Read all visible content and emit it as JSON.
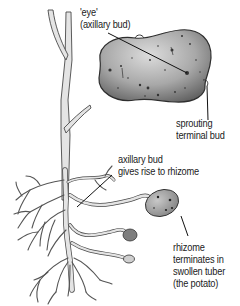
{
  "diagram": {
    "colors": {
      "outline": "#3a3a3a",
      "stem_fill": "#e2e2e2",
      "tuber_fill": "#9a9a9a",
      "tuber_highlight": "#d6d6d6",
      "leader_line": "#111111",
      "background": "#ffffff"
    },
    "labels": [
      {
        "id": "eye",
        "lines": [
          "'eye'",
          "(axillary bud)"
        ]
      },
      {
        "id": "terminal-bud",
        "lines": [
          "sprouting",
          "terminal bud"
        ]
      },
      {
        "id": "axillary-rhizome",
        "lines": [
          "axillary bud",
          "gives rise to rhizome"
        ]
      },
      {
        "id": "tuber",
        "lines": [
          "rhizome",
          "terminates in",
          "swollen tuber",
          "(the potato)"
        ]
      }
    ]
  }
}
